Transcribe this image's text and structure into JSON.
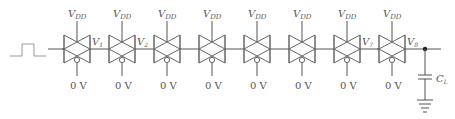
{
  "diagram": {
    "input": {
      "signal": "pulse"
    },
    "gates": [
      {
        "id": 1,
        "top_label": "V",
        "top_sub": "DD",
        "bottom_label": "0 V",
        "output_label": "V",
        "output_sub": "1"
      },
      {
        "id": 2,
        "top_label": "V",
        "top_sub": "DD",
        "bottom_label": "0 V",
        "output_label": "V",
        "output_sub": "2"
      },
      {
        "id": 3,
        "top_label": "V",
        "top_sub": "DD",
        "bottom_label": "0 V",
        "output_label": "",
        "output_sub": ""
      },
      {
        "id": 4,
        "top_label": "V",
        "top_sub": "DD",
        "bottom_label": "0 V",
        "output_label": "",
        "output_sub": ""
      },
      {
        "id": 5,
        "top_label": "V",
        "top_sub": "DD",
        "bottom_label": "0 V",
        "output_label": "",
        "output_sub": ""
      },
      {
        "id": 6,
        "top_label": "V",
        "top_sub": "DD",
        "bottom_label": "0 V",
        "output_label": "",
        "output_sub": ""
      },
      {
        "id": 7,
        "top_label": "V",
        "top_sub": "DD",
        "bottom_label": "0 V",
        "output_label": "V",
        "output_sub": "7"
      },
      {
        "id": 8,
        "top_label": "V",
        "top_sub": "DD",
        "bottom_label": "0 V",
        "output_label": "V",
        "output_sub": "8"
      }
    ],
    "load": {
      "label": "C",
      "sub": "L"
    },
    "ground": "ground-symbol"
  }
}
